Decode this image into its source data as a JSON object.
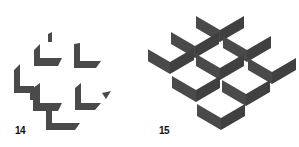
{
  "figures": [
    {
      "label": "14",
      "description": "scattered L-shaped fragments"
    },
    {
      "label": "15",
      "description": "isometric grid of nine chevron corners"
    }
  ],
  "colors": {
    "shape": "#4a4a4a",
    "shape_dark": "#3c3c3c",
    "background": "#ffffff",
    "label": "#111111"
  }
}
